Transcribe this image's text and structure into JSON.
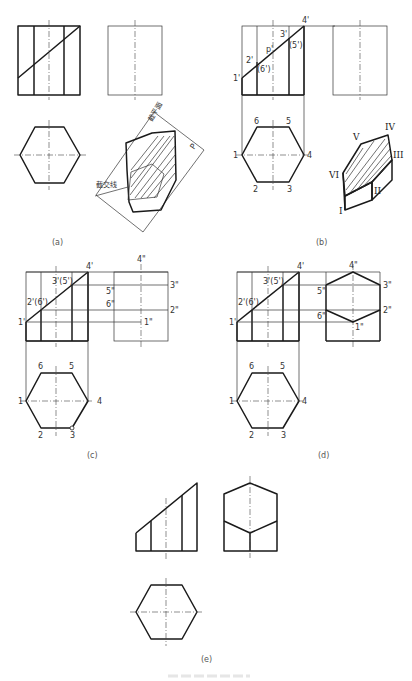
{
  "figure": {
    "panels": [
      {
        "id": "a",
        "caption": "(a)",
        "annotations": {
          "cutting_plane": "截平面",
          "intersection_line": "截交线",
          "plane_symbol": "P"
        }
      },
      {
        "id": "b",
        "caption": "(b)",
        "front_labels": [
          "1'",
          "2'",
          "p'",
          "3'",
          "4'",
          "(6')",
          "(5')"
        ],
        "top_labels": [
          "1",
          "2",
          "3",
          "4",
          "5",
          "6"
        ],
        "iso_labels": [
          "I",
          "II",
          "III",
          "IV",
          "V",
          "VI"
        ]
      },
      {
        "id": "c",
        "caption": "(c)",
        "front_labels": [
          "1'",
          "2'(6')",
          "3'(5')",
          "4'"
        ],
        "side_labels": [
          "4\"",
          "3\"",
          "5\"",
          "6\"",
          "2\"",
          "1\""
        ],
        "top_labels": [
          "1",
          "2",
          "3",
          "4",
          "5",
          "6"
        ]
      },
      {
        "id": "d",
        "caption": "(d)",
        "front_labels": [
          "1'",
          "2'(6')",
          "3'(5')",
          "4'"
        ],
        "side_labels": [
          "4\"",
          "3\"",
          "5\"",
          "6\"",
          "2\"",
          "1\""
        ],
        "top_labels": [
          "1",
          "2",
          "3",
          "4",
          "5",
          "6"
        ]
      },
      {
        "id": "e",
        "caption": "(e)"
      }
    ],
    "bottom_caption": ""
  }
}
